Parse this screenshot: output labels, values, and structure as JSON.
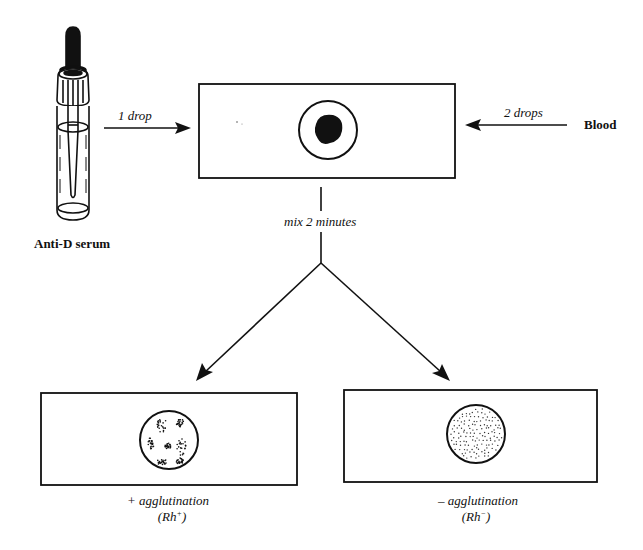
{
  "diagram": {
    "type": "process-flow",
    "reagent": {
      "label": "Anti-D serum",
      "icon": "dropper-bottle-icon"
    },
    "sample": {
      "label": "Blood"
    },
    "steps": {
      "reagent_amount": "1 drop",
      "sample_amount": "2 drops",
      "mix_instruction": "mix 2 minutes"
    },
    "outcomes": [
      {
        "result_line": "+ agglutination",
        "rh_base": "(Rh",
        "rh_sup": "+",
        "rh_close": ")",
        "pattern": "clumped"
      },
      {
        "result_line": "– agglutination",
        "rh_base": "(Rh",
        "rh_sup": "−",
        "rh_close": ")",
        "pattern": "uniform-dots"
      }
    ],
    "colors": {
      "ink": "#111111",
      "background": "#ffffff"
    }
  }
}
